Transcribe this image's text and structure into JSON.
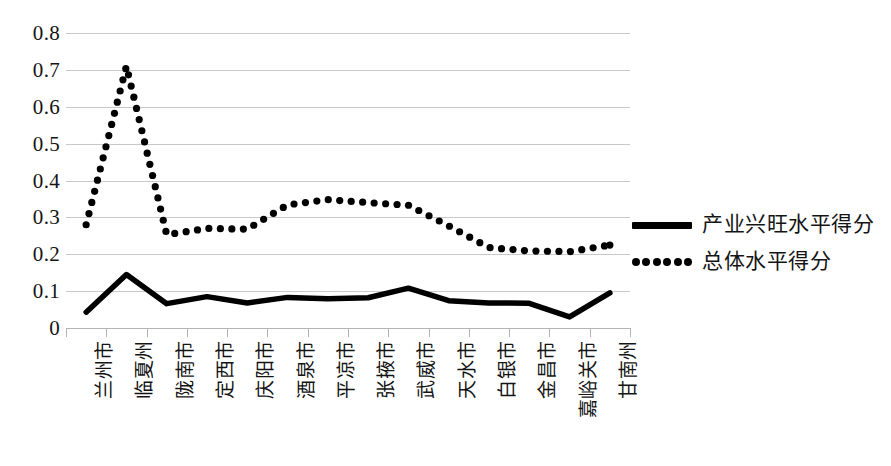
{
  "chart_data": {
    "type": "line",
    "title": "",
    "xlabel": "",
    "ylabel": "",
    "ylim": [
      0,
      0.8
    ],
    "ytick_values": [
      0.8,
      0.7,
      0.6,
      0.5,
      0.4,
      0.3,
      0.2,
      0.1,
      0
    ],
    "ytick_labels": [
      "0.8",
      "0.7",
      "0.6",
      "0.5",
      "0.4",
      "0.3",
      "0.2",
      "0.1",
      "0"
    ],
    "grid": true,
    "legend_position": "right",
    "categories": [
      "兰州市",
      "临夏州",
      "陇南市",
      "定西市",
      "庆阳市",
      "酒泉市",
      "平凉市",
      "张掖市",
      "武威市",
      "天水市",
      "白银市",
      "金昌市",
      "嘉峪关市",
      "甘南州"
    ],
    "series": [
      {
        "name": "产业兴旺水平得分",
        "style": "solid",
        "color": "#000000",
        "values": [
          0.043,
          0.145,
          0.066,
          0.085,
          0.068,
          0.083,
          0.079,
          0.082,
          0.108,
          0.074,
          0.068,
          0.067,
          0.03,
          0.095
        ]
      },
      {
        "name": "总体水平得分",
        "style": "dotted",
        "color": "#000000",
        "values": [
          0.28,
          0.71,
          0.253,
          0.27,
          0.268,
          0.334,
          0.348,
          0.34,
          0.333,
          0.277,
          0.218,
          0.209,
          0.207,
          0.225
        ]
      }
    ]
  },
  "legend": {
    "items": [
      {
        "label": "产业兴旺水平得分",
        "marker": "solid-line-marker"
      },
      {
        "label": "总体水平得分",
        "marker": "dotted-line-marker"
      }
    ]
  }
}
